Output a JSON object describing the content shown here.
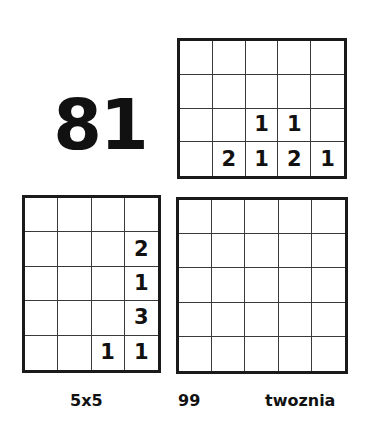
{
  "page": {
    "background_color": "#ffffff",
    "ink_color": "#111111",
    "grid_line_color": "#3a3a3a",
    "grid_border_color": "#1a1a1a"
  },
  "big_number": {
    "value": "81"
  },
  "grids": {
    "top_right": {
      "name": "top-right-grid",
      "columns": 5,
      "rows": 4,
      "cells": [
        [
          "",
          "",
          "",
          "",
          ""
        ],
        [
          "",
          "",
          "",
          "",
          ""
        ],
        [
          "",
          "",
          "1",
          "1",
          ""
        ],
        [
          "",
          "2",
          "1",
          "2",
          "1"
        ]
      ]
    },
    "bottom_left": {
      "name": "bottom-left-grid",
      "columns": 4,
      "rows": 5,
      "cells": [
        [
          "",
          "",
          "",
          ""
        ],
        [
          "",
          "",
          "",
          "2"
        ],
        [
          "",
          "",
          "",
          "1"
        ],
        [
          "",
          "",
          "",
          "3"
        ],
        [
          "",
          "",
          "1",
          "1"
        ]
      ]
    },
    "bottom_right": {
      "name": "bottom-right-grid",
      "columns": 5,
      "rows": 5,
      "cells": [
        [
          "",
          "",
          "",
          "",
          ""
        ],
        [
          "",
          "",
          "",
          "",
          ""
        ],
        [
          "",
          "",
          "",
          "",
          ""
        ],
        [
          "",
          "",
          "",
          "",
          ""
        ],
        [
          "",
          "",
          "",
          "",
          ""
        ]
      ]
    }
  },
  "captions": {
    "size_label": "5x5",
    "number_label": "99",
    "word_label": "twoznia"
  }
}
